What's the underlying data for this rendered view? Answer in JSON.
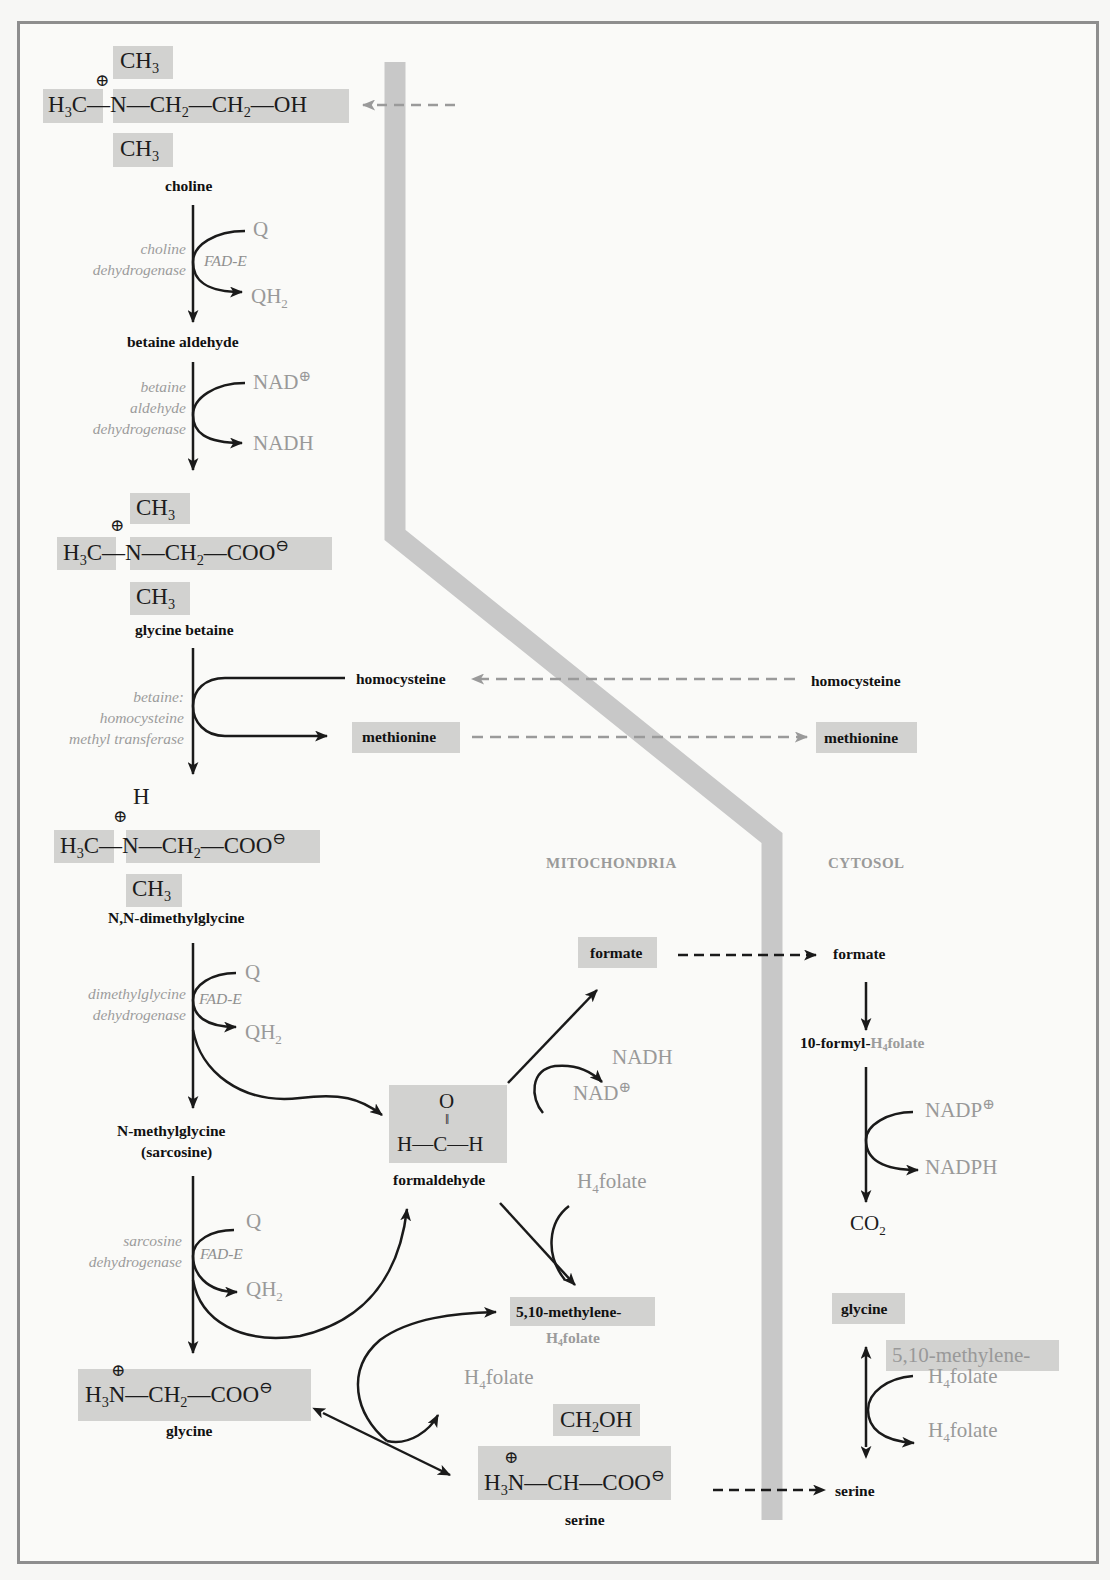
{
  "figure": {
    "regions": {
      "mitochondria": "MITOCHONDRIA",
      "cytosol": "CYTOSOL"
    },
    "colors": {
      "membrane": "#c8c8c8",
      "highlight": "#d2d2d0",
      "arrow": "#1a1a1a",
      "dashed_transport_grey": "#9a9a9a",
      "cofactor_text": "#999999",
      "frame": "#8e8e8e"
    }
  },
  "molecules": {
    "choline": {
      "name": "choline",
      "top_methyl": "CH3",
      "left_methyl": "H3C",
      "nitrogen": "N",
      "charge": "⊕",
      "chain": "—CH2—CH2—OH",
      "bottom_methyl": "CH3"
    },
    "betaine_aldehyde": {
      "name": "betaine aldehyde"
    },
    "glycine_betaine": {
      "name": "glycine betaine",
      "top_methyl": "CH3",
      "left_methyl": "H3C",
      "nitrogen": "N",
      "charge": "⊕",
      "chain": "—CH2—COO",
      "anion": "⊖",
      "bottom_methyl": "CH3"
    },
    "dimethylglycine": {
      "name": "N,N-dimethylglycine",
      "top": "H",
      "left_methyl": "H3C",
      "nitrogen": "N",
      "charge": "⊕",
      "chain": "—CH2—COO",
      "anion": "⊖",
      "bottom_methyl": "CH3"
    },
    "sarcosine": {
      "name_line1": "N-methylglycine",
      "name_line2": "(sarcosine)"
    },
    "glycine": {
      "name": "glycine",
      "formula": "H3N—CH2—COO",
      "charge": "⊕",
      "anion": "⊖"
    },
    "formaldehyde": {
      "name": "formaldehyde",
      "o": "O",
      "formula": "H—C—H"
    },
    "formate_mito": {
      "name": "formate"
    },
    "methylene_h4folate_mito": {
      "line1": "5,10-methylene-",
      "line2": "H4folate"
    },
    "serine_mito": {
      "name": "serine",
      "side_chain": "CH2OH",
      "backbone": "H3N—CH—COO",
      "charge": "⊕",
      "anion": "⊖"
    },
    "homocysteine_mito": {
      "name": "homocysteine"
    },
    "methionine_mito": {
      "name": "methionine"
    },
    "homocysteine_cyto": {
      "name": "homocysteine"
    },
    "methionine_cyto": {
      "name": "methionine"
    },
    "formate_cyto": {
      "name": "formate"
    },
    "formyl_h4folate_cyto": {
      "prefix": "10-formyl-",
      "suffix": "H4folate"
    },
    "co2": {
      "name": "CO2"
    },
    "glycine_cyto": {
      "name": "glycine"
    },
    "serine_cyto": {
      "name": "serine"
    }
  },
  "enzymes": {
    "choline_dh": [
      "choline",
      "dehydrogenase"
    ],
    "betaine_aldehyde_dh": [
      "betaine",
      "aldehyde",
      "dehydrogenase"
    ],
    "bhmt": [
      "betaine:",
      "homocysteine",
      "methyl transferase"
    ],
    "dmg_dh": [
      "dimethylglycine",
      "dehydrogenase"
    ],
    "sarcosine_dh": [
      "sarcosine",
      "dehydrogenase"
    ]
  },
  "cofactors": {
    "step1": {
      "in": "Q",
      "out": "QH2",
      "enzyme_bound": "FAD-E"
    },
    "step2": {
      "in": "NAD⊕",
      "out": "NADH"
    },
    "step4": {
      "in": "Q",
      "out": "QH2",
      "enzyme_bound": "FAD-E"
    },
    "step5": {
      "in": "Q",
      "out": "QH2",
      "enzyme_bound": "FAD-E"
    },
    "formaldehyde_to_formate": {
      "in": "NAD⊕",
      "out": "NADH"
    },
    "formaldehyde_to_methylene": {
      "in": "H4folate"
    },
    "glycine_serine_mito": {
      "out": "H4folate"
    },
    "formyl_to_co2": {
      "in": "NADP⊕",
      "out": "NADPH"
    },
    "glycine_serine_cyto": {
      "in_line1": "5,10-methylene-",
      "in_line2": "H4folate",
      "out": "H4folate"
    }
  }
}
